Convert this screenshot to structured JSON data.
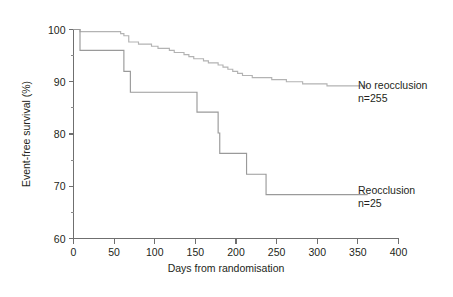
{
  "chart_data": {
    "type": "line",
    "title": "",
    "subtitle": "",
    "xlabel": "Days from randomisation",
    "ylabel": "Event-free survival (%)",
    "xlim": [
      0,
      400
    ],
    "ylim": [
      60,
      100
    ],
    "grid": false,
    "legend_position": "inline-right-of-curves",
    "x_ticks": [
      0,
      50,
      100,
      150,
      200,
      250,
      300,
      350,
      400
    ],
    "x_tick_labels": [
      "0",
      "50",
      "100",
      "150",
      "200",
      "250",
      "300",
      "350",
      "400"
    ],
    "y_ticks": [
      60,
      70,
      80,
      90,
      100
    ],
    "y_tick_labels": [
      "60",
      "70",
      "80",
      "90",
      "100"
    ],
    "y_minor_ticks": [
      65,
      75,
      85,
      95
    ],
    "series": [
      {
        "name": "No reocclusion",
        "label_line1": "No reocclusion",
        "label_line2": "n=255",
        "n": 255,
        "color": "#b3b3b3",
        "step": "post",
        "x": [
          0,
          4,
          8,
          14,
          55,
          58,
          62,
          68,
          74,
          80,
          88,
          96,
          104,
          112,
          118,
          124,
          130,
          136,
          142,
          148,
          154,
          160,
          166,
          172,
          178,
          184,
          190,
          196,
          202,
          208,
          214,
          220,
          228,
          236,
          244,
          252,
          262,
          272,
          282,
          292,
          302,
          312,
          322,
          362
        ],
        "y": [
          100.0,
          100.0,
          99.6,
          99.6,
          99.6,
          99.2,
          98.8,
          97.6,
          97.6,
          97.2,
          97.2,
          96.8,
          96.4,
          96.4,
          96.0,
          95.6,
          95.6,
          95.2,
          94.8,
          94.4,
          94.4,
          94.0,
          93.6,
          93.6,
          93.2,
          92.8,
          92.4,
          92.0,
          91.6,
          91.2,
          91.2,
          90.8,
          90.8,
          90.8,
          90.4,
          90.4,
          90.0,
          90.0,
          89.6,
          89.6,
          89.6,
          89.2,
          89.2,
          89.2
        ]
      },
      {
        "name": "Reocclusion",
        "label_line1": "Reocclusion",
        "label_line2": "n=25",
        "n": 25,
        "color": "#9a9a9a",
        "step": "post",
        "x": [
          0,
          8,
          57,
          62,
          70,
          138,
          152,
          160,
          178,
          180,
          211,
          213,
          237,
          362
        ],
        "y": [
          100.0,
          96.0,
          96.0,
          92.0,
          88.0,
          88.0,
          84.2,
          84.2,
          80.2,
          76.3,
          76.3,
          72.3,
          68.4,
          68.4
        ]
      }
    ],
    "annotations": [
      {
        "name": "no-reocclusion-label",
        "line1": "No reocclusion",
        "line2": "n=255",
        "x_px": 358,
        "y_px": 88
      },
      {
        "name": "reocclusion-label",
        "line1": "Reocclusion",
        "line2": "n=25",
        "x_px": 358,
        "y_px": 193
      }
    ]
  },
  "axes": {
    "y_axis_title": "Event-free survival (%)",
    "x_axis_title": "Days from randomisation"
  },
  "colors": {
    "background": "#ffffff",
    "axis": "#6f6f6f",
    "text": "#231f20",
    "series_no_reocclusion": "#b3b3b3",
    "series_reocclusion": "#9a9a9a"
  }
}
